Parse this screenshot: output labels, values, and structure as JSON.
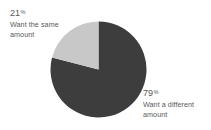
{
  "figure": {
    "background_color": "#ffffff",
    "text_color": "#595959"
  },
  "chart_data": {
    "type": "pie",
    "title": "",
    "categories": [
      "Want the same amount",
      "Want a different amount"
    ],
    "values": [
      21,
      79
    ],
    "value_unit": "percent",
    "labels": [
      "21%",
      "79%"
    ],
    "colors": [
      "#c8c8c8",
      "#3d3d3d"
    ],
    "legend": "none",
    "grid": false,
    "start_angle_deg": 0,
    "direction": "counterclockwise-light-clockwise-dark",
    "slices": [
      {
        "name": "want-same",
        "percent_number": "21",
        "percent_sign": "%",
        "description_line_1": "Want the same",
        "description_line_2": "amount",
        "color": "#c8c8c8",
        "value": 21
      },
      {
        "name": "want-different",
        "percent_number": "79",
        "percent_sign": "%",
        "description_line_1": "Want a different",
        "description_line_2": "amount",
        "color": "#3d3d3d",
        "value": 79
      }
    ]
  },
  "annotations": {
    "top_left": {
      "percent_number": "21",
      "percent_sign": "%",
      "line_1": "Want the same",
      "line_2": "amount"
    },
    "bottom_right": {
      "percent_number": "79",
      "percent_sign": "%",
      "line_1": "Want a different",
      "line_2": "amount"
    }
  }
}
